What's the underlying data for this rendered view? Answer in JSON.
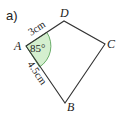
{
  "part_label": "a)",
  "shape": {
    "type": "quadrilateral",
    "vertices": [
      {
        "name": "A",
        "x": 26,
        "y": 46
      },
      {
        "name": "D",
        "x": 64,
        "y": 21
      },
      {
        "name": "C",
        "x": 105,
        "y": 44
      },
      {
        "name": "B",
        "x": 65,
        "y": 103
      }
    ],
    "stroke_color": "#333333"
  },
  "labels": {
    "A": "A",
    "B": "B",
    "C": "C",
    "D": "D"
  },
  "measurements": {
    "side_AD": "3cm",
    "side_AB": "4.5cm",
    "angle_A": "85°"
  },
  "colors": {
    "angle_fill": "#d4efcf",
    "angle_stroke": "#4a9a4a",
    "line": "#333333"
  }
}
